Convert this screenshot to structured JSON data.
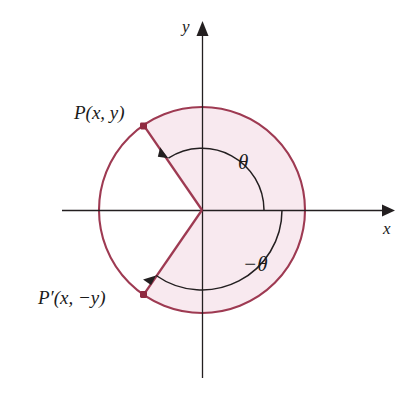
{
  "figure": {
    "background_color": "#ffffff",
    "colors": {
      "circle_stroke": "#9e3a52",
      "sector_fill": "#f8e9ef",
      "axis_stroke": "#231f20",
      "arc_stroke": "#231f20",
      "point_marker": "#8f2a40",
      "label_text": "#1a1a1a"
    },
    "axes": {
      "x_label": "x",
      "y_label": "y",
      "origin": {
        "x": 202,
        "y": 210
      }
    },
    "circle": {
      "center_x": 202,
      "center_y": 210,
      "radius": 103
    },
    "points": [
      {
        "name": "P",
        "label": "P(x, y)",
        "angle_deg": 125,
        "x": 143,
        "y": 126
      },
      {
        "name": "P-prime",
        "label": "P′(x, −y)",
        "angle_deg": -125,
        "x": 143,
        "y": 294
      }
    ],
    "angles": [
      {
        "name": "theta",
        "label": "θ",
        "direction": "counterclockwise",
        "from_deg": 0,
        "to_deg": 125,
        "arc_radius": 62
      },
      {
        "name": "negative-theta",
        "label": "−θ",
        "direction": "clockwise",
        "from_deg": 0,
        "to_deg": -125,
        "arc_radius": 80
      }
    ],
    "shaded_sector": {
      "description": "Sector swept from -125 degrees counterclockwise through 0 to +125 degrees",
      "start_deg": -125,
      "end_deg": 125
    }
  }
}
